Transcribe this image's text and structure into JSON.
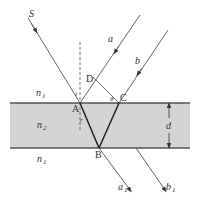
{
  "diagram": {
    "type": "optics-refraction-slab",
    "colors": {
      "slab_fill": "#d4d4d4",
      "slab_border": "#555555",
      "ray": "#555555",
      "refracted_ray": "#222222",
      "background": "#ffffff"
    },
    "media": {
      "top": {
        "label": "n",
        "sub": "1"
      },
      "middle": {
        "label": "n",
        "sub": "2"
      },
      "bottom": {
        "label": "n",
        "sub": "1"
      }
    },
    "points": {
      "S": "S",
      "A": "A",
      "B": "B",
      "C": "C",
      "D": "D"
    },
    "rays": {
      "a": {
        "label": "a"
      },
      "b": {
        "label": "b"
      },
      "a1": {
        "label": "a",
        "sub": "1"
      },
      "b1": {
        "label": "b",
        "sub": "1"
      }
    },
    "angles": {
      "incidence": "i",
      "refraction": "r",
      "theta": "θ"
    },
    "thickness": {
      "label": "d"
    }
  }
}
